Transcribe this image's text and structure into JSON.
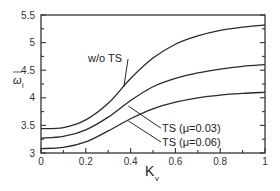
{
  "chart_data": {
    "type": "line",
    "title": "",
    "xlabel": "K",
    "xlabel_subscript": "v",
    "ylabel": "ω",
    "ylabel_subscript": "l",
    "ylabel_overbar": true,
    "xlim": [
      0,
      1
    ],
    "ylim": [
      3,
      5.5
    ],
    "x_ticks": [
      0,
      0.2,
      0.4,
      0.6,
      0.8,
      1
    ],
    "x_tick_labels": [
      "0",
      "0.2",
      "0.4",
      "0.6",
      "0.8",
      "1"
    ],
    "y_ticks": [
      3,
      3.5,
      4,
      4.5,
      5,
      5.5
    ],
    "y_tick_labels": [
      "3",
      "3.5",
      "4",
      "4.5",
      "5",
      "5.5"
    ],
    "grid": false,
    "legend": "none (inline annotations)",
    "x": [
      0,
      0.1,
      0.2,
      0.3,
      0.4,
      0.5,
      0.6,
      0.7,
      0.8,
      0.9,
      1.0
    ],
    "series": [
      {
        "name": "w/o TS",
        "values": [
          3.44,
          3.46,
          3.6,
          3.9,
          4.35,
          4.72,
          4.97,
          5.12,
          5.22,
          5.28,
          5.32
        ]
      },
      {
        "name": "TS (μ=0.03)",
        "values": [
          3.27,
          3.3,
          3.42,
          3.65,
          3.95,
          4.2,
          4.35,
          4.45,
          4.52,
          4.57,
          4.6
        ]
      },
      {
        "name": "TS (μ=0.06)",
        "values": [
          3.08,
          3.1,
          3.2,
          3.4,
          3.62,
          3.8,
          3.92,
          4.0,
          4.05,
          4.08,
          4.1
        ]
      }
    ],
    "annotations": [
      {
        "text": "w/o TS",
        "series": 0,
        "text_x": 0.21,
        "text_y": 4.72,
        "arrow_to_x": 0.37,
        "arrow_to_y": 4.2
      },
      {
        "text": "TS (μ=0.03)",
        "series": 1,
        "text_x": 0.54,
        "text_y": 3.45,
        "arrow_to_x": 0.39,
        "arrow_to_y": 3.85
      },
      {
        "text": "TS (μ=0.06)",
        "series": 2,
        "text_x": 0.54,
        "text_y": 3.2,
        "arrow_to_x": 0.39,
        "arrow_to_y": 3.58
      }
    ]
  }
}
